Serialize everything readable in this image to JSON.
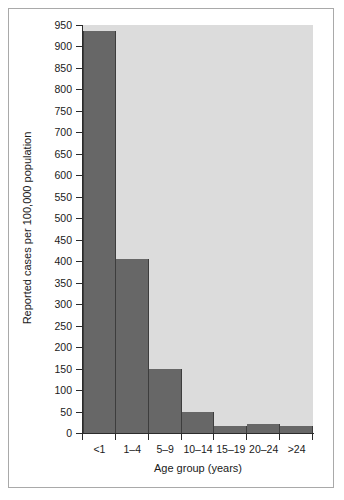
{
  "chart_data": {
    "type": "bar",
    "title": "",
    "subtitle": "",
    "xlabel": "Age group (years)",
    "ylabel": "Reported cases per 100,000 population",
    "categories": [
      "<1",
      "1–4",
      "5–9",
      "10–14",
      "15–19",
      "20–24",
      ">24"
    ],
    "values": [
      935,
      405,
      150,
      48,
      17,
      22,
      16
    ],
    "ylim": [
      0,
      950
    ],
    "yticks": [
      0,
      50,
      100,
      150,
      200,
      250,
      300,
      350,
      400,
      450,
      500,
      550,
      600,
      650,
      700,
      750,
      800,
      850,
      900,
      950
    ],
    "ytick_labels": [
      "0",
      "50",
      "100",
      "150",
      "200",
      "250",
      "300",
      "350",
      "400",
      "450",
      "500",
      "550",
      "600",
      "650",
      "700",
      "750",
      "800",
      "850",
      "900",
      "950"
    ],
    "grid": false,
    "legend": null,
    "legend_position": "none",
    "series": [
      {
        "name": "Reported cases per 100,000 population",
        "values": [
          935,
          405,
          150,
          48,
          17,
          22,
          16
        ]
      }
    ],
    "annotations": []
  },
  "style": {
    "bar_color": "#676767",
    "bar_edge_color": "#3d3d3d",
    "plot_background": "#dcdcdc",
    "figure_background": "#ffffff",
    "frame_color": "#a9a9a9",
    "axis_color": "#2b2b2b",
    "text_color": "#1a1a1a"
  }
}
